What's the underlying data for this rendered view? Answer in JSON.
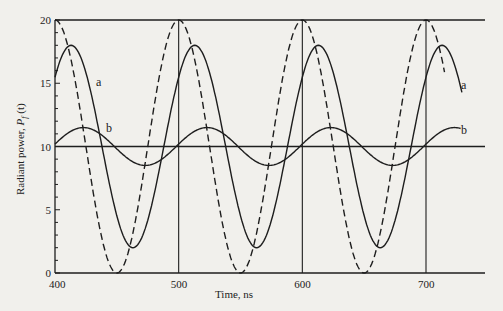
{
  "chart_data": {
    "type": "line",
    "title": "",
    "xlabel": "Time, ns",
    "ylabel": "Radiant power, P_f (t)",
    "ylabel_parts": {
      "main": "Radiant power, ",
      "symbol": "P",
      "subscript": "f",
      "arg": " (t)"
    },
    "xlim": [
      400,
      730
    ],
    "ylim": [
      0,
      20
    ],
    "x_ticks": [
      400,
      500,
      600,
      700
    ],
    "y_ticks": [
      0,
      5,
      10,
      15,
      20
    ],
    "y_minor_ticks_every": 1,
    "grid": {
      "vertical_lines_at": [
        500,
        600,
        700
      ],
      "horizontal_lines_at": [
        10,
        20
      ]
    },
    "legend": null,
    "series": [
      {
        "name": "excitation (dashed)",
        "style": "dashed",
        "mean": 10,
        "amplitude": 10,
        "period_ns": 100,
        "peak_ns": 500,
        "t_end": 715,
        "x": [
          400,
          425,
          450,
          475,
          500,
          525,
          550,
          575,
          600,
          625,
          650,
          675,
          700
        ],
        "values": [
          20,
          10,
          0,
          10,
          20,
          10,
          0,
          10,
          20,
          10,
          0,
          10,
          20
        ]
      },
      {
        "name": "a",
        "style": "solid",
        "mean": 10,
        "amplitude": 8,
        "period_ns": 100,
        "peak_ns": 513,
        "t_end": 729,
        "x": [
          400,
          413,
          438,
          463,
          488,
          513,
          538,
          563,
          588,
          613,
          638,
          663,
          688,
          713
        ],
        "values": [
          16.5,
          18,
          10,
          2,
          10,
          18,
          10,
          2,
          10,
          18,
          10,
          2,
          10,
          18
        ]
      },
      {
        "name": "b",
        "style": "solid",
        "mean": 10,
        "amplitude": 1.5,
        "period_ns": 100,
        "peak_ns": 423,
        "t_end": 728,
        "x": [
          400,
          423,
          448,
          473,
          498,
          523,
          548,
          573,
          598,
          623,
          648,
          673,
          698,
          723
        ],
        "values": [
          10.2,
          11.5,
          10,
          8.5,
          10,
          11.5,
          10,
          8.5,
          10,
          11.5,
          10,
          8.5,
          10,
          11.5
        ]
      }
    ],
    "annotations": [
      {
        "text": "a",
        "near_series": "a",
        "positions": [
          "left",
          "right"
        ]
      },
      {
        "text": "b",
        "near_series": "b",
        "positions": [
          "left",
          "right"
        ]
      }
    ]
  }
}
